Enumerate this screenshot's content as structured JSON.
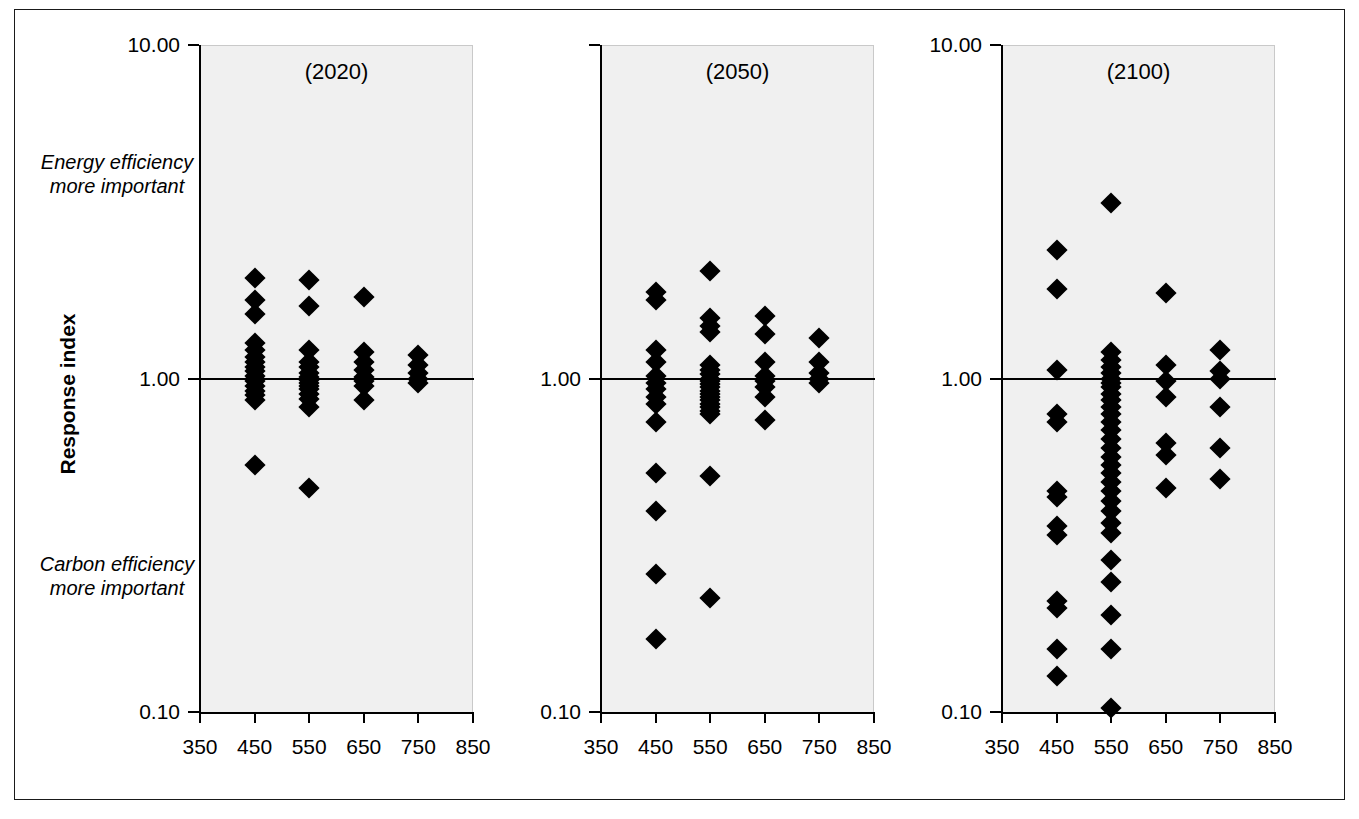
{
  "axis_title": "Response index",
  "notes": {
    "top": "Energy efficiency\nmore important",
    "bottom": "Carbon efficiency\nmore important"
  },
  "chart_data": {
    "type": "scatter",
    "title": "",
    "xlabel": "",
    "ylabel": "Response index",
    "yscale": "log",
    "ylim": [
      0.1,
      10.0
    ],
    "xlim": [
      350,
      850
    ],
    "ytick_labels": [
      "10.00",
      "1.00",
      "0.10"
    ],
    "ytick_values": [
      10.0,
      1.0,
      0.1
    ],
    "xtick_labels": [
      "350",
      "450",
      "550",
      "650",
      "750",
      "850"
    ],
    "xtick_values": [
      350,
      450,
      550,
      650,
      750,
      850
    ],
    "reference_line": 1.0,
    "grid": false,
    "legend": "none",
    "annotations": [
      "Energy efficiency more important",
      "Carbon efficiency more important"
    ],
    "panels": [
      {
        "label": "(2020)",
        "show_ytick_labels": [
          "10.00",
          "1.00",
          "0.10"
        ],
        "series": [
          {
            "x": 450,
            "values": [
              2.0,
              1.72,
              1.56,
              1.28,
              1.22,
              1.16,
              1.12,
              1.08,
              1.05,
              1.02,
              1.0,
              0.98,
              0.95,
              0.92,
              0.89,
              0.86,
              0.55
            ]
          },
          {
            "x": 550,
            "values": [
              1.98,
              1.65,
              1.22,
              1.12,
              1.08,
              1.04,
              1.01,
              0.99,
              0.97,
              0.95,
              0.93,
              0.9,
              0.87,
              0.82,
              0.47
            ]
          },
          {
            "x": 650,
            "values": [
              1.76,
              1.2,
              1.12,
              1.06,
              1.01,
              0.98,
              0.95,
              0.86
            ]
          },
          {
            "x": 750,
            "values": [
              1.18,
              1.1,
              1.04,
              1.0,
              0.97
            ]
          }
        ]
      },
      {
        "label": "(2050)",
        "show_ytick_labels": [
          "1.00",
          "0.10"
        ],
        "series": [
          {
            "x": 450,
            "values": [
              1.82,
              1.72,
              1.22,
              1.12,
              1.02,
              0.97,
              0.93,
              0.88,
              0.84,
              0.74,
              0.52,
              0.4,
              0.26,
              0.165
            ]
          },
          {
            "x": 550,
            "values": [
              2.1,
              1.52,
              1.44,
              1.38,
              1.1,
              1.06,
              1.03,
              1.0,
              0.98,
              0.96,
              0.94,
              0.92,
              0.9,
              0.88,
              0.86,
              0.84,
              0.82,
              0.8,
              0.78,
              0.51,
              0.22
            ]
          },
          {
            "x": 650,
            "values": [
              1.54,
              1.36,
              1.12,
              1.02,
              0.98,
              0.94,
              0.88,
              0.75
            ]
          },
          {
            "x": 750,
            "values": [
              1.32,
              1.12,
              1.04,
              1.0,
              0.97
            ]
          }
        ]
      },
      {
        "label": "(2100)",
        "show_ytick_labels": [
          "10.00",
          "1.00",
          "0.10"
        ],
        "series": [
          {
            "x": 450,
            "values": [
              2.42,
              1.85,
              1.06,
              0.78,
              0.74,
              0.46,
              0.44,
              0.36,
              0.34,
              0.215,
              0.205,
              0.155,
              0.128
            ]
          },
          {
            "x": 550,
            "values": [
              3.35,
              1.2,
              1.14,
              1.08,
              1.04,
              1.0,
              0.97,
              0.94,
              0.9,
              0.86,
              0.82,
              0.78,
              0.74,
              0.7,
              0.66,
              0.62,
              0.58,
              0.55,
              0.52,
              0.49,
              0.46,
              0.43,
              0.4,
              0.37,
              0.345,
              0.285,
              0.245,
              0.195,
              0.155,
              0.103
            ]
          },
          {
            "x": 650,
            "values": [
              1.8,
              1.1,
              0.98,
              0.88,
              0.64,
              0.59,
              0.47
            ]
          },
          {
            "x": 750,
            "values": [
              1.22,
              1.05,
              1.0,
              0.82,
              0.62,
              0.5
            ]
          }
        ]
      }
    ]
  }
}
